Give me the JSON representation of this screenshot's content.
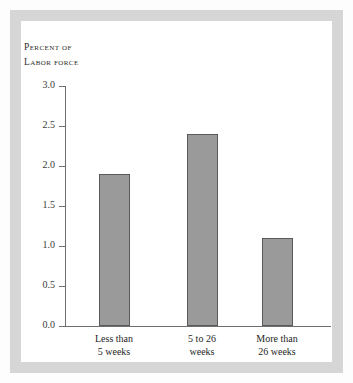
{
  "figure": {
    "axis_title_lines": [
      "Percent of",
      "Labor force"
    ],
    "frame_color": "#d6d6d6",
    "panel_color": "#ffffff",
    "bar_fill": "#9a9a9a",
    "bar_stroke": "#5a5a5a",
    "axis_color": "#6e6e6e"
  },
  "chart_data": {
    "type": "bar",
    "title": "",
    "subtitle": "",
    "xlabel": "",
    "ylabel": "Percent of Labor Force",
    "categories": [
      "Less than 5 weeks",
      "5 to 26 weeks",
      "More than 26 weeks"
    ],
    "category_lines": [
      [
        "Less than",
        "5 weeks"
      ],
      [
        "5 to 26",
        "weeks"
      ],
      [
        "More than",
        "26 weeks"
      ]
    ],
    "values": [
      1.9,
      2.4,
      1.1
    ],
    "ylim": [
      0.0,
      3.0
    ],
    "ytick_values": [
      0.0,
      0.5,
      1.0,
      1.5,
      2.0,
      2.5,
      3.0
    ],
    "ytick_labels": [
      "0.0",
      "0.5",
      "1.0",
      "1.5",
      "2.0",
      "2.5",
      "3.0"
    ],
    "grid": false,
    "legend": null
  }
}
